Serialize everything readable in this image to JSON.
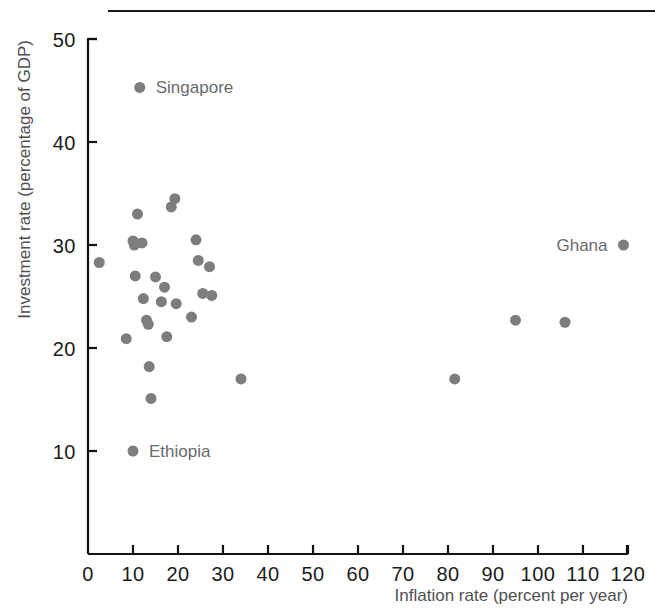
{
  "chart_data": {
    "type": "scatter",
    "title": "",
    "xlabel": "Inflation rate (percent per year)",
    "ylabel": "Investment rate (percentage of GDP)",
    "xlim": [
      0,
      120
    ],
    "ylim": [
      0,
      50
    ],
    "xticks": [
      0,
      10,
      20,
      30,
      40,
      50,
      60,
      70,
      80,
      90,
      100,
      110,
      120
    ],
    "xtick_labels": [
      "0",
      "10",
      "20",
      "30",
      "40",
      "50",
      "60",
      "70",
      "80",
      "90",
      "100",
      "110",
      "120"
    ],
    "yticks": [
      10,
      20,
      30,
      40,
      50
    ],
    "ytick_labels": [
      "10",
      "20",
      "30",
      "40",
      "50"
    ],
    "grid": false,
    "legend": "none",
    "marker_color": "#7d7d80",
    "marker_size": 11,
    "points": [
      {
        "x": 2.5,
        "y": 28.3,
        "label": ""
      },
      {
        "x": 8.5,
        "y": 20.9,
        "label": ""
      },
      {
        "x": 10.0,
        "y": 30.4,
        "label": ""
      },
      {
        "x": 10.3,
        "y": 30.0,
        "label": ""
      },
      {
        "x": 10.5,
        "y": 27.0,
        "label": ""
      },
      {
        "x": 11.0,
        "y": 33.0,
        "label": ""
      },
      {
        "x": 12.0,
        "y": 30.2,
        "label": ""
      },
      {
        "x": 12.3,
        "y": 24.8,
        "label": ""
      },
      {
        "x": 13.0,
        "y": 22.7,
        "label": ""
      },
      {
        "x": 13.4,
        "y": 22.3,
        "label": ""
      },
      {
        "x": 13.6,
        "y": 18.2,
        "label": ""
      },
      {
        "x": 14.0,
        "y": 15.1,
        "label": ""
      },
      {
        "x": 15.0,
        "y": 26.9,
        "label": ""
      },
      {
        "x": 16.3,
        "y": 24.5,
        "label": ""
      },
      {
        "x": 17.0,
        "y": 25.9,
        "label": ""
      },
      {
        "x": 17.5,
        "y": 21.1,
        "label": ""
      },
      {
        "x": 18.5,
        "y": 33.7,
        "label": ""
      },
      {
        "x": 19.3,
        "y": 34.5,
        "label": ""
      },
      {
        "x": 19.6,
        "y": 24.3,
        "label": ""
      },
      {
        "x": 23.0,
        "y": 23.0,
        "label": ""
      },
      {
        "x": 24.0,
        "y": 30.5,
        "label": ""
      },
      {
        "x": 24.5,
        "y": 28.5,
        "label": ""
      },
      {
        "x": 25.5,
        "y": 25.3,
        "label": ""
      },
      {
        "x": 27.0,
        "y": 27.9,
        "label": ""
      },
      {
        "x": 27.5,
        "y": 25.1,
        "label": ""
      },
      {
        "x": 34.0,
        "y": 17.0,
        "label": ""
      },
      {
        "x": 81.5,
        "y": 17.0,
        "label": ""
      },
      {
        "x": 95.0,
        "y": 22.7,
        "label": ""
      },
      {
        "x": 106.0,
        "y": 22.5,
        "label": ""
      },
      {
        "x": 10.0,
        "y": 10.0,
        "label": "Ethiopia",
        "label_side": "right"
      },
      {
        "x": 11.5,
        "y": 45.3,
        "label": "Singapore",
        "label_side": "right"
      },
      {
        "x": 119.0,
        "y": 30.0,
        "label": "Ghana",
        "label_side": "left"
      }
    ]
  }
}
